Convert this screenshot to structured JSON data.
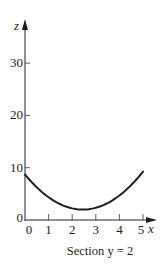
{
  "chart_data": {
    "type": "line",
    "title": "",
    "caption": "Section y = 2",
    "xlabel": "x",
    "ylabel": "z",
    "xlim": [
      0,
      5
    ],
    "ylim": [
      0,
      35
    ],
    "x_ticks": [
      0,
      1,
      2,
      3,
      4,
      5
    ],
    "x_tick_labels": [
      "0",
      "1",
      "2",
      "3",
      "4",
      "5"
    ],
    "y_ticks": [
      0,
      10,
      20,
      30
    ],
    "y_tick_labels": [
      "0",
      "10",
      "20",
      "30"
    ],
    "grid": false,
    "legend": null,
    "series": [
      {
        "name": "z at y = 2",
        "x": [
          0,
          0.5,
          1,
          1.5,
          2,
          2.45,
          3,
          3.5,
          4,
          4.5,
          5
        ],
        "values": [
          8.7,
          6.4,
          4.3,
          3.0,
          2.2,
          2.0,
          2.3,
          3.2,
          4.7,
          6.7,
          9.3
        ]
      }
    ],
    "line_color": "#231f20"
  }
}
